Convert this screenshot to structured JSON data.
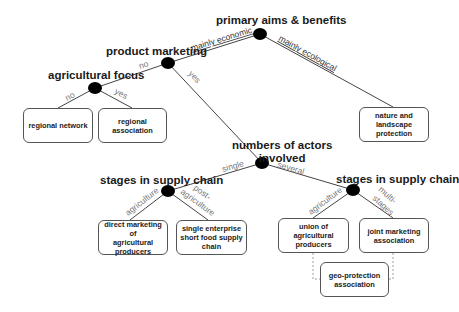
{
  "diagram": {
    "type": "decision-tree",
    "nodes": {
      "primary_aims": "primary aims & benefits",
      "product_marketing": "product marketing",
      "agricultural_focus": "agricultural focus",
      "numbers_of_actors_line1": "numbers of actors",
      "numbers_of_actors_line2": "involved",
      "stages_left": "stages in supply chain",
      "stages_right": "stages in supply chain"
    },
    "edges": {
      "mainly_economic": "mainly economic",
      "mainly_ecological": "mainly ecological",
      "pm_no": "no",
      "pm_yes": "yes",
      "af_no": "no",
      "af_yes": "yes",
      "single": "single",
      "several": "several",
      "left_agriculture": "agriculture",
      "left_post_1": "post-",
      "left_post_2": "agriculture",
      "right_agriculture": "agriculture",
      "right_multi_1": "multi-",
      "right_multi_2": "stages"
    },
    "outcomes": {
      "regional_network": "regional network",
      "regional_association": "regional\nassociation",
      "nature_landscape": "nature and\nlandscape\nprotection",
      "direct_marketing": "direct marketing of\nagricultural\nproducers",
      "single_enterprise": "single enterprise\nshort food supply\nchain",
      "union": "union of\nagricultural\nproducers",
      "joint_marketing": "joint marketing\nassociation",
      "geo_protection": "geo-protection\nassociation"
    }
  },
  "colors": {
    "node": "#000000",
    "line": "#444444",
    "box_border": "#555555",
    "edge_label": "#777777"
  }
}
